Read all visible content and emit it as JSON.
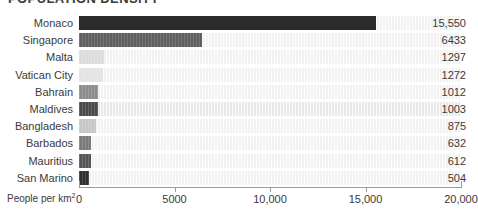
{
  "chart_data": {
    "type": "bar",
    "orientation": "horizontal",
    "title": "POPULATION DENSITY",
    "title_cropped": true,
    "categories": [
      "Monaco",
      "Singapore",
      "Malta",
      "Vatican City",
      "Bahrain",
      "Maldives",
      "Bangladesh",
      "Barbados",
      "Mauritius",
      "San Marino"
    ],
    "values": [
      15550,
      6433,
      1297,
      1272,
      1012,
      1003,
      875,
      632,
      612,
      504
    ],
    "value_labels": [
      "15,550",
      "6433",
      "1297",
      "1272",
      "1012",
      "1003",
      "875",
      "632",
      "612",
      "504"
    ],
    "xlabel": "People per km",
    "xlabel_sup": "2",
    "ylabel": "",
    "xlim": [
      0,
      20000
    ],
    "xticks": [
      0,
      5000,
      10000,
      15000,
      20000
    ],
    "xtick_labels": [
      "0",
      "5000",
      "10,000",
      "15,000",
      "20,000"
    ],
    "grid": false,
    "legend": null,
    "bar_colors": [
      "#2b2b2b",
      "#5e5e5e",
      "#dcdcdc",
      "#e4e4e4",
      "#8c8c8c",
      "#4a4a4a",
      "#c7c7c7",
      "#7a7a7a",
      "#555555",
      "#2f2f2f"
    ]
  },
  "axis": {
    "tick_label_0": "0",
    "tick_label_1": "5000",
    "tick_label_2": "10,000",
    "tick_label_3": "15,000",
    "tick_label_4": "20,000",
    "x_axis_caption": "People per km",
    "x_axis_caption_sup": "2"
  }
}
